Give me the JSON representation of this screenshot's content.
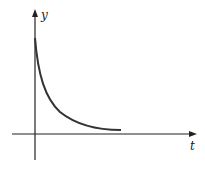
{
  "diagram": {
    "type": "decay-curve-sketch",
    "axes": {
      "x_label": "t",
      "y_label": "y"
    },
    "curve": {
      "description": "exponential decay starting high on y-axis, approaching t-axis asymptotically",
      "color": "#333333"
    },
    "axis_color": "#222222",
    "background": "#ffffff"
  }
}
